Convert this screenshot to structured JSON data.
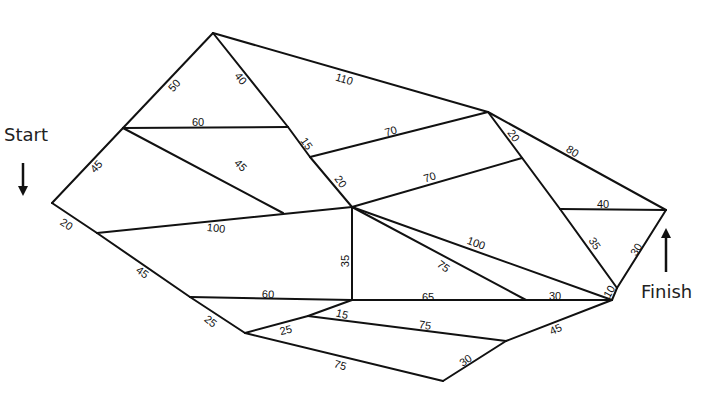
{
  "labels": {
    "start": "Start",
    "finish": "Finish"
  },
  "colors": {
    "line": "#111111",
    "background": "#ffffff"
  },
  "nodes": {
    "A": [
      52,
      203
    ],
    "B": [
      123,
      128
    ],
    "C": [
      213,
      33
    ],
    "D": [
      288,
      127
    ],
    "G": [
      310,
      157
    ],
    "E": [
      352,
      207
    ],
    "H": [
      488,
      112
    ],
    "I": [
      522,
      158
    ],
    "J": [
      560,
      209
    ],
    "K": [
      666,
      210
    ],
    "V": [
      617,
      288
    ],
    "L": [
      612,
      300
    ],
    "M": [
      97,
      233
    ],
    "N": [
      283,
      213
    ],
    "O": [
      190,
      297
    ],
    "P": [
      352,
      300
    ],
    "Q": [
      526,
      300
    ],
    "R": [
      245,
      333
    ],
    "S": [
      308,
      316
    ],
    "T": [
      506,
      341
    ],
    "U": [
      443,
      381
    ]
  },
  "edges": [
    {
      "from": "A",
      "to": "B",
      "weight": "45",
      "lx": 97,
      "ly": 167,
      "rot": -47
    },
    {
      "from": "B",
      "to": "C",
      "weight": "50",
      "lx": 175,
      "ly": 86,
      "rot": -47
    },
    {
      "from": "C",
      "to": "D",
      "weight": "40",
      "lx": 240,
      "ly": 79,
      "rot": 52
    },
    {
      "from": "B",
      "to": "D",
      "weight": "60",
      "lx": 198,
      "ly": 123,
      "rot": 0
    },
    {
      "from": "C",
      "to": "H",
      "weight": "110",
      "lx": 344,
      "ly": 80,
      "rot": 17
    },
    {
      "from": "D",
      "to": "G",
      "weight": "15",
      "lx": 306,
      "ly": 144,
      "rot": 55
    },
    {
      "from": "G",
      "to": "E",
      "weight": "20",
      "lx": 340,
      "ly": 182,
      "rot": 55
    },
    {
      "from": "G",
      "to": "H",
      "weight": "70",
      "lx": 391,
      "ly": 132,
      "rot": -16
    },
    {
      "from": "E",
      "to": "I",
      "weight": "70",
      "lx": 430,
      "ly": 178,
      "rot": -17
    },
    {
      "from": "H",
      "to": "K",
      "weight": "80",
      "lx": 572,
      "ly": 152,
      "rot": 33
    },
    {
      "from": "H",
      "to": "J",
      "weight": "20",
      "lx": 513,
      "ly": 136,
      "rot": 55
    },
    {
      "from": "J",
      "to": "V",
      "weight": "35",
      "lx": 594,
      "ly": 244,
      "rot": 57
    },
    {
      "from": "J",
      "to": "K",
      "weight": "40",
      "lx": 603,
      "ly": 205,
      "rot": 0
    },
    {
      "from": "K",
      "to": "V",
      "weight": "30",
      "lx": 637,
      "ly": 250,
      "rot": -58
    },
    {
      "from": "V",
      "to": "L",
      "weight": "10",
      "lx": 610,
      "ly": 292,
      "rot": -60
    },
    {
      "from": "A",
      "to": "M",
      "weight": "20",
      "lx": 66,
      "ly": 225,
      "rot": 33
    },
    {
      "from": "M",
      "to": "E",
      "weight": "100",
      "lx": 216,
      "ly": 229,
      "rot": 6
    },
    {
      "from": "B",
      "to": "N",
      "weight": "45",
      "lx": 240,
      "ly": 166,
      "rot": 45
    },
    {
      "from": "M",
      "to": "O",
      "weight": "45",
      "lx": 142,
      "ly": 273,
      "rot": 35
    },
    {
      "from": "E",
      "to": "P",
      "weight": "35",
      "lx": 346,
      "ly": 261,
      "rot": -90
    },
    {
      "from": "E",
      "to": "L",
      "weight": "100",
      "lx": 476,
      "ly": 244,
      "rot": 20
    },
    {
      "from": "E",
      "to": "Q",
      "weight": "75",
      "lx": 443,
      "ly": 267,
      "rot": 37
    },
    {
      "from": "O",
      "to": "P",
      "weight": "60",
      "lx": 268,
      "ly": 295,
      "rot": 2
    },
    {
      "from": "P",
      "to": "L",
      "weight": "65",
      "lx": 428,
      "ly": 298,
      "rot": 0
    },
    {
      "from": "Q",
      "to": "L",
      "weight": "30",
      "lx": 555,
      "ly": 297,
      "rot": 0
    },
    {
      "from": "O",
      "to": "R",
      "weight": "25",
      "lx": 210,
      "ly": 322,
      "rot": 38
    },
    {
      "from": "R",
      "to": "S",
      "weight": "25",
      "lx": 286,
      "ly": 331,
      "rot": -14
    },
    {
      "from": "S",
      "to": "P",
      "weight": "15",
      "lx": 342,
      "ly": 315,
      "rot": 14
    },
    {
      "from": "S",
      "to": "T",
      "weight": "75",
      "lx": 425,
      "ly": 326,
      "rot": 8
    },
    {
      "from": "T",
      "to": "L",
      "weight": "45",
      "lx": 556,
      "ly": 330,
      "rot": -25
    },
    {
      "from": "R",
      "to": "U",
      "weight": "75",
      "lx": 340,
      "ly": 366,
      "rot": 17
    },
    {
      "from": "U",
      "to": "T",
      "weight": "30",
      "lx": 466,
      "ly": 361,
      "rot": -35
    }
  ]
}
